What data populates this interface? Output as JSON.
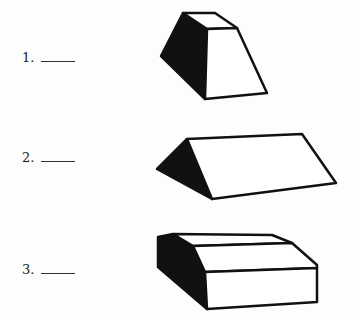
{
  "questions": [
    {
      "number": "1.",
      "shape": "truncated-pyramid-frustum"
    },
    {
      "number": "2.",
      "shape": "triangular-prism"
    },
    {
      "number": "3.",
      "shape": "beveled-box"
    }
  ],
  "colors": {
    "ink": "#111111",
    "paper": "#fdfdfb",
    "face": "#ffffff"
  }
}
